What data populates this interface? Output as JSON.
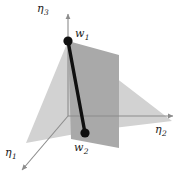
{
  "figure": {
    "background_color": "#ffffff",
    "axes": {
      "color": "#8c8c8c",
      "items": [
        {
          "name": "eta3",
          "label_main": "η",
          "label_sub": "3",
          "orientation": "vertical-up",
          "tip": [
            68,
            13
          ],
          "origin": [
            68,
            116
          ]
        },
        {
          "name": "eta2",
          "label_main": "η",
          "label_sub": "2",
          "orientation": "horizontal-right",
          "tip": [
            174,
            116
          ],
          "origin": [
            68,
            116
          ]
        },
        {
          "name": "eta1",
          "label_main": "η",
          "label_sub": "1",
          "orientation": "diagonal-down-left",
          "tip": [
            21,
            171
          ],
          "origin": [
            68,
            116
          ]
        }
      ]
    },
    "planes": [
      {
        "name": "light-plane",
        "fill": "#d2d2d2",
        "description": "light grey triangular plane spanning from w1 down past the eta1 axis and out to the right",
        "points": "68,41 26,143 96,129 172,121"
      },
      {
        "name": "dark-plane",
        "fill": "#a9a9a9",
        "description": "darker grey quadrilateral plane standing vertically behind the segment",
        "points": "68,41 119,55 119,148 71,139"
      }
    ],
    "segment": {
      "name": "segment-w1-w2",
      "color": "#101010",
      "width_px": 3.4,
      "from": [
        68,
        41
      ],
      "to": [
        85,
        133
      ]
    },
    "points": [
      {
        "name": "w1",
        "label_main": "w",
        "label_sub": "1",
        "cx": 68,
        "cy": 41,
        "r": 4.6,
        "color": "#101010"
      },
      {
        "name": "w2",
        "label_main": "w",
        "label_sub": "2",
        "cx": 85,
        "cy": 133,
        "r": 4.6,
        "color": "#101010"
      }
    ],
    "labels": {
      "eta3": {
        "main": "η",
        "sub": "3"
      },
      "eta2": {
        "main": "η",
        "sub": "2"
      },
      "eta1": {
        "main": "η",
        "sub": "1"
      },
      "w1": {
        "main": "w",
        "sub": "1"
      },
      "w2": {
        "main": "w",
        "sub": "2"
      }
    }
  }
}
